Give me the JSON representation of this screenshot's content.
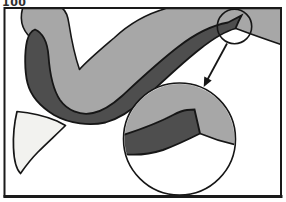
{
  "page": {
    "corner_label": "100"
  },
  "figure": {
    "type": "anatomical-cross-section-with-magnified-inset",
    "colors": {
      "background": "#ffffff",
      "light_layer": "#a7a7a7",
      "dark_layer": "#4e4e4e",
      "tooth": "#f2f2ef",
      "outline": "#161616",
      "frame": "#1a1a1a",
      "text": "#2f2f2f"
    },
    "elements": {
      "frame": "rectangular-border-frame",
      "surface_layer": "light-gray-curved-layer",
      "deep_layer": "dark-gray-layer-with-tapered-tip",
      "tooth": "white-tooth-shape",
      "detail_marker": "small-circle-marker-around-layer-tip",
      "arrow": "pointer-arrow-from-marker-to-inset",
      "inset": "magnified-circular-inset-of-layer-tip"
    }
  }
}
